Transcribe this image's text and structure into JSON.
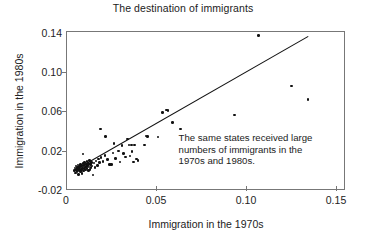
{
  "chart_data": {
    "type": "scatter",
    "title": "The destination of immigrants",
    "xlabel": "Immigration in the 1970s",
    "ylabel": "Immigration in the 1980s",
    "xlim": [
      0,
      0.155
    ],
    "ylim": [
      -0.02,
      0.142
    ],
    "xticks": [
      0,
      0.05,
      0.1,
      0.15
    ],
    "xtick_labels": [
      "0",
      "0.05",
      "0.10",
      "0.15"
    ],
    "yticks": [
      -0.02,
      0.02,
      0.06,
      0.1,
      0.14
    ],
    "ytick_labels": [
      "-0.02",
      "0.02",
      "0.06",
      "0.10",
      "0.14"
    ],
    "grid": false,
    "legend": false,
    "annotation": {
      "lines": [
        "The same states received large",
        "numbers of immigrants in the",
        "1970s and 1980s."
      ],
      "x": 0.062,
      "y": 0.034
    },
    "trendline": {
      "label": "least-squares fit",
      "x": [
        0.0035,
        0.135
      ],
      "y": [
        -0.0015,
        0.1375
      ],
      "color": "#111111"
    },
    "series": [
      {
        "name": "states",
        "marker": "filled-circle",
        "color": "#111111",
        "points": [
          [
            0.0042,
            0.001
          ],
          [
            0.0045,
            0.0035
          ],
          [
            0.0048,
            -0.0015
          ],
          [
            0.005,
            0.0055
          ],
          [
            0.0052,
            0.002
          ],
          [
            0.0055,
            0.0
          ],
          [
            0.0058,
            0.0042
          ],
          [
            0.006,
            0.0018
          ],
          [
            0.0062,
            0.0065
          ],
          [
            0.0063,
            -0.003
          ],
          [
            0.0065,
            0.003
          ],
          [
            0.0067,
            0.0008
          ],
          [
            0.007,
            0.005
          ],
          [
            0.0072,
            0.0022
          ],
          [
            0.0074,
            0.0
          ],
          [
            0.0076,
            0.007
          ],
          [
            0.0078,
            0.0035
          ],
          [
            0.008,
            0.0012
          ],
          [
            0.0082,
            0.0058
          ],
          [
            0.0084,
            -0.002
          ],
          [
            0.0086,
            0.0028
          ],
          [
            0.0088,
            0.0082
          ],
          [
            0.009,
            0.0045
          ],
          [
            0.0092,
            0.0005
          ],
          [
            0.0094,
            0.0062
          ],
          [
            0.0096,
            0.0025
          ],
          [
            0.0098,
            0.009
          ],
          [
            0.01,
            0.004
          ],
          [
            0.0102,
            0.0015
          ],
          [
            0.0105,
            0.0072
          ],
          [
            0.0108,
            0.005
          ],
          [
            0.011,
            0.0098
          ],
          [
            0.0112,
            0.003
          ],
          [
            0.0115,
            0.006
          ],
          [
            0.0118,
            0.0008
          ],
          [
            0.012,
            0.0078
          ],
          [
            0.0122,
            0.0045
          ],
          [
            0.0125,
            0.011
          ],
          [
            0.0128,
            0.0022
          ],
          [
            0.013,
            0.0068
          ],
          [
            0.0133,
            0.0038
          ],
          [
            0.0136,
            0.0092
          ],
          [
            0.014,
            0.0055
          ],
          [
            0.0145,
            -0.0035
          ],
          [
            0.015,
            0.0085
          ],
          [
            0.0155,
            0.004
          ],
          [
            0.009,
            0.0175
          ],
          [
            0.016,
            0.0105
          ],
          [
            0.0168,
            0.0062
          ],
          [
            0.0175,
            0.0125
          ],
          [
            0.018,
            0.0088
          ],
          [
            0.0185,
            0.043
          ],
          [
            0.019,
            0.0142
          ],
          [
            0.02,
            0.01
          ],
          [
            0.021,
            0.016
          ],
          [
            0.0215,
            0.0358
          ],
          [
            0.0225,
            0.012
          ],
          [
            0.0235,
            0.0068
          ],
          [
            0.024,
            0.0072
          ],
          [
            0.0248,
            0.007
          ],
          [
            0.0255,
            0.0188
          ],
          [
            0.026,
            0.0285
          ],
          [
            0.027,
            0.013
          ],
          [
            0.0285,
            0.0208
          ],
          [
            0.0295,
            0.0095
          ],
          [
            0.0305,
            0.0262
          ],
          [
            0.0315,
            0.018
          ],
          [
            0.0325,
            0.0148
          ],
          [
            0.0335,
            0.033
          ],
          [
            0.0345,
            0.027
          ],
          [
            0.035,
            0.0155
          ],
          [
            0.0358,
            0.0268
          ],
          [
            0.0362,
            0.0205
          ],
          [
            0.0368,
            0.0095
          ],
          [
            0.0375,
            0.0268
          ],
          [
            0.0385,
            0.0125
          ],
          [
            0.0395,
            0.0108
          ],
          [
            0.043,
            0.0268
          ],
          [
            0.044,
            0.036
          ],
          [
            0.0448,
            0.0355
          ],
          [
            0.0505,
            0.0352
          ],
          [
            0.053,
            0.0598
          ],
          [
            0.0552,
            0.0625
          ],
          [
            0.056,
            0.062
          ],
          [
            0.0585,
            0.0498
          ],
          [
            0.063,
            0.043
          ],
          [
            0.093,
            0.0575
          ],
          [
            0.1065,
            0.1382
          ],
          [
            0.1248,
            0.0868
          ],
          [
            0.1338,
            0.0735
          ]
        ]
      }
    ]
  }
}
